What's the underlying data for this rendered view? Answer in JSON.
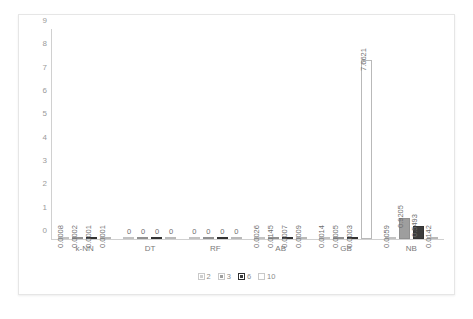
{
  "chart_data": {
    "type": "bar",
    "title": "",
    "xlabel": "",
    "ylabel": "",
    "ylim": [
      0,
      9
    ],
    "yticks": [
      0,
      1,
      2,
      3,
      4,
      5,
      6,
      7,
      8,
      9
    ],
    "grid": false,
    "legend_position": "bottom",
    "categories": [
      "k-NN",
      "DT",
      "RF",
      "AB",
      "GB",
      "NB"
    ],
    "series": [
      {
        "name": "2",
        "color": "#cfcfcf",
        "values": [
          0.0008,
          0,
          0,
          0.0026,
          0.0014,
          0.0059
        ],
        "labels": [
          "0.0008",
          "0",
          "0",
          "0.0026",
          "0.0014",
          "0.0059"
        ]
      },
      {
        "name": "3",
        "color": "#9e9e9e",
        "values": [
          0.0002,
          0,
          0,
          0.0145,
          0.0005,
          0.9205
        ],
        "labels": [
          "0.0002",
          "0",
          "0",
          "0.0145",
          "0.0005",
          "0.9205"
        ]
      },
      {
        "name": "6",
        "color": "#3d3d3d",
        "values": [
          0.0001,
          0,
          0,
          0.0007,
          0.0003,
          0.5493
        ],
        "labels": [
          "0.0001",
          "0",
          "0",
          "0.0007",
          "0.0003",
          "0.5493"
        ]
      },
      {
        "name": "10",
        "color": "#ffffff",
        "values": [
          0.0001,
          0,
          0,
          0.0009,
          7.6621,
          0.0142
        ],
        "labels": [
          "0.0001",
          "0",
          "0",
          "0.0009",
          "7.6621",
          "0.0142"
        ]
      }
    ]
  },
  "legend": {
    "items": [
      {
        "label": "2"
      },
      {
        "label": "3"
      },
      {
        "label": "6"
      },
      {
        "label": "10"
      }
    ]
  }
}
